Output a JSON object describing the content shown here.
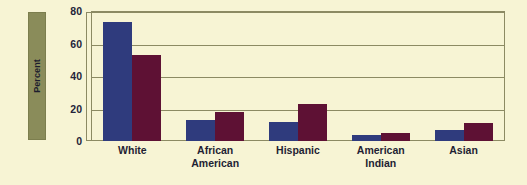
{
  "chart_data": {
    "type": "bar",
    "title": "",
    "xlabel": "",
    "ylabel": "Percent",
    "ylim": [
      0,
      80
    ],
    "yticks": [
      0,
      20,
      40,
      60,
      80
    ],
    "ytick_labels": [
      "0",
      "20",
      "40",
      "60",
      "80"
    ],
    "grid": true,
    "legend": "none",
    "categories": [
      "White",
      "African American",
      "Hispanic",
      "American Indian",
      "Asian"
    ],
    "category_lines": [
      [
        "White"
      ],
      [
        "African",
        "American"
      ],
      [
        "Hispanic"
      ],
      [
        "American",
        "Indian"
      ],
      [
        "Asian"
      ]
    ],
    "series": [
      {
        "name": "series-navy",
        "color": "#2f3b7d",
        "values": [
          73,
          13,
          12,
          4,
          7
        ]
      },
      {
        "name": "series-maroon",
        "color": "#5e1134",
        "values": [
          53,
          18,
          23,
          5,
          11
        ]
      }
    ]
  },
  "style": {
    "background": "#f7f4d4",
    "axis_line": "#8c8a63",
    "label_block": "#8a8c5a",
    "text": "#1f1f33"
  }
}
